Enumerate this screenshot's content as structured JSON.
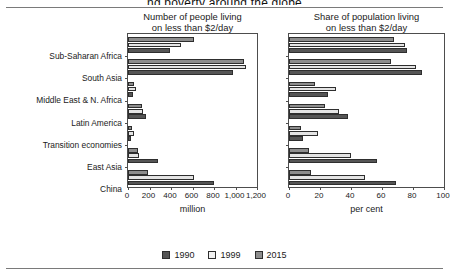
{
  "figure": {
    "title_partial": "ng poverty around the globe",
    "legend": [
      {
        "label": "1990",
        "swatch": "sw1990",
        "color": "#555555"
      },
      {
        "label": "1999",
        "swatch": "sw1999",
        "color": "#f2f2f2"
      },
      {
        "label": "2015",
        "swatch": "sw2015",
        "color": "#8d8d8d"
      }
    ]
  },
  "categories": [
    "Sub-Saharan Africa",
    "South Asia",
    "Middle East & N. Africa",
    "Latin America",
    "Transition economies",
    "East Asia",
    "China"
  ],
  "chart_data": [
    {
      "type": "bar",
      "orientation": "horizontal",
      "title": "Number of people living\non less than $2/day",
      "title_line1": "Number of people living",
      "title_line2": "on less than $2/day",
      "xlabel": "million",
      "ylabel": "",
      "xlim": [
        0,
        1200
      ],
      "xticks": [
        0,
        200,
        400,
        600,
        800,
        1000,
        1200
      ],
      "xticklabels": [
        "0",
        "200",
        "400",
        "600",
        "800",
        "1,000",
        "1,200"
      ],
      "grid": false,
      "legend_position": "bottom-center",
      "categories": [
        "Sub-Saharan Africa",
        "South Asia",
        "Middle East & N. Africa",
        "Latin America",
        "Transition economies",
        "East Asia",
        "China"
      ],
      "series": [
        {
          "name": "1990",
          "values": [
            390,
            980,
            50,
            170,
            30,
            280,
            800
          ]
        },
        {
          "name": "1999",
          "values": [
            490,
            1100,
            70,
            140,
            60,
            100,
            610
          ]
        },
        {
          "name": "2015",
          "values": [
            610,
            1080,
            60,
            130,
            40,
            90,
            190
          ]
        }
      ]
    },
    {
      "type": "bar",
      "orientation": "horizontal",
      "title": "Share of population living\non less than $2/day",
      "title_line1": "Share of population living",
      "title_line2": "on less than $2/day",
      "xlabel": "per cent",
      "ylabel": "",
      "xlim": [
        0,
        100
      ],
      "xticks": [
        0,
        20,
        40,
        60,
        80,
        100
      ],
      "xticklabels": [
        "0",
        "20",
        "40",
        "60",
        "80",
        "100"
      ],
      "grid": false,
      "legend_position": "bottom-center",
      "categories": [
        "Sub-Saharan Africa",
        "South Asia",
        "Middle East & N. Africa",
        "Latin America",
        "Transition economies",
        "East Asia",
        "China"
      ],
      "series": [
        {
          "name": "1990",
          "values": [
            76,
            86,
            25,
            38,
            9,
            57,
            69
          ]
        },
        {
          "name": "1999",
          "values": [
            75,
            82,
            30,
            32,
            19,
            40,
            49
          ]
        },
        {
          "name": "2015",
          "values": [
            68,
            66,
            17,
            23,
            8,
            13,
            14
          ]
        }
      ]
    }
  ]
}
